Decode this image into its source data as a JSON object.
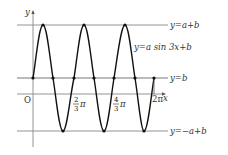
{
  "diagram": {
    "axes": {
      "x_label": "x",
      "y_label": "y",
      "origin_label": "O"
    },
    "lines": {
      "top": "y=a+b",
      "mid": "y=b",
      "bottom": "y=−a+b"
    },
    "curve_label": "y=a sin 3x+b",
    "ticks": [
      {
        "num": "2",
        "den": "3",
        "suffix": "π"
      },
      {
        "num": "4",
        "den": "3",
        "suffix": "π"
      },
      {
        "text": "2π"
      }
    ],
    "colors": {
      "curve": "#111111",
      "guides": "#888888",
      "text": "#333333"
    }
  }
}
